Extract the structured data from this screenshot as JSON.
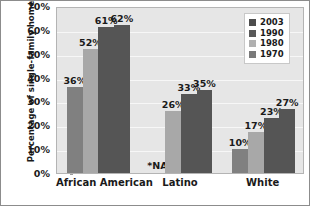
{
  "chart_data": {
    "type": "bar",
    "title": "",
    "xlabel": "",
    "ylabel": "Percentage of single-family homes",
    "categories": [
      "African American",
      "Latino",
      "White"
    ],
    "series": [
      {
        "name": "2003",
        "color": "#808080",
        "values": [
          36,
          null,
          10
        ],
        "labels": [
          "36%",
          "*NA",
          "10%"
        ]
      },
      {
        "name": "1990",
        "color": "#a8a8a8",
        "values": [
          52,
          26,
          17
        ],
        "labels": [
          "52%",
          "26%",
          "17%"
        ]
      },
      {
        "name": "1980",
        "color": "#555555",
        "values": [
          61,
          33,
          23
        ],
        "labels": [
          "61%",
          "33%",
          "23%"
        ]
      },
      {
        "name": "1970",
        "color": "#555555",
        "values": [
          62,
          35,
          27
        ],
        "labels": [
          "62%",
          "35%",
          "27%"
        ]
      }
    ],
    "ylim": [
      0,
      70
    ],
    "yticks": [
      "0%",
      "10%",
      "20%",
      "30%",
      "40%",
      "50%",
      "60%",
      "70%"
    ],
    "ytick_values": [
      0,
      10,
      20,
      30,
      40,
      50,
      60,
      70
    ],
    "grid": true,
    "legend_position": "top-right",
    "na_note": "*NA"
  },
  "legend": {
    "entries": [
      {
        "label": "2003",
        "color": "#4d4d4d"
      },
      {
        "label": "1990",
        "color": "#595959"
      },
      {
        "label": "1980",
        "color": "#b0b0b0"
      },
      {
        "label": "1970",
        "color": "#7a7a7a"
      }
    ]
  },
  "colors": {
    "plot_background": "#e6e6e6",
    "gridline": "#f7f7f7",
    "frame_border": "#8c8c8c",
    "text": "#1a1a1a"
  }
}
